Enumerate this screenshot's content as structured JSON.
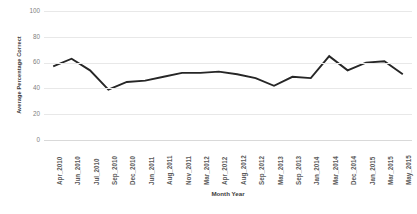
{
  "chart_data": {
    "type": "line",
    "title": "",
    "xlabel": "Month Year",
    "ylabel": "Average Percentage Correct",
    "ylim": [
      0,
      100
    ],
    "yticks": [
      0,
      20,
      40,
      60,
      80,
      100
    ],
    "grid": true,
    "legend": "none",
    "line_color": "#262626",
    "categories": [
      "Apr_2010",
      "Jun_2010",
      "Jul_2010",
      "Sep_2010",
      "Dec_2010",
      "Jun_2011",
      "Aug_2011",
      "Nov_2011",
      "Mar_2012",
      "Apr_2012",
      "Aug_2012",
      "Sep_2012",
      "Mar_2013",
      "Sep_2013",
      "Jan_2014",
      "Mar_2014",
      "Dec_2014",
      "Jan_2015",
      "Mar_2015",
      "May_2015"
    ],
    "values": [
      57,
      63,
      54,
      39,
      45,
      46,
      49,
      52,
      52,
      53,
      51,
      48,
      42,
      49,
      48,
      65,
      54,
      60,
      61,
      51
    ]
  }
}
